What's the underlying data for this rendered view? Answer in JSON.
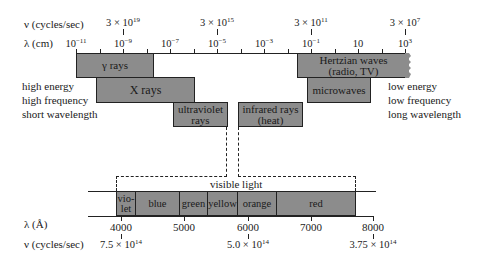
{
  "top_axis": {
    "freq_label": "ν (cycles/sec)",
    "wave_label": "λ (cm)",
    "wavelength_ticks": [
      {
        "base": "10",
        "exp": "−11",
        "x": 76
      },
      {
        "base": "10",
        "exp": "−9",
        "x": 123
      },
      {
        "base": "10",
        "exp": "−7",
        "x": 170
      },
      {
        "base": "10",
        "exp": "−5",
        "x": 217
      },
      {
        "base": "10",
        "exp": "−3",
        "x": 264
      },
      {
        "base": "10",
        "exp": "−1",
        "x": 311
      },
      {
        "base": "10",
        "exp": "",
        "x": 358
      },
      {
        "base": "10",
        "exp": "3",
        "x": 405
      }
    ],
    "frequency_ticks": [
      {
        "base": "3 × 10",
        "exp": "19",
        "x": 123
      },
      {
        "base": "3 × 10",
        "exp": "15",
        "x": 217
      },
      {
        "base": "3 × 10",
        "exp": "11",
        "x": 311
      },
      {
        "base": "3 × 10",
        "exp": "7",
        "x": 405
      }
    ]
  },
  "bands": {
    "gamma": "γ rays",
    "xray": "X rays",
    "uv_1": "ultraviolet",
    "uv_2": "rays",
    "ir_1": "infrared rays",
    "ir_2": "(heat)",
    "hertz_1": "Hertzian waves",
    "hertz_2": "(radio, TV)",
    "micro": "microwaves"
  },
  "left_notes": [
    "high energy",
    "high frequency",
    "short wavelength"
  ],
  "right_notes": [
    "low energy",
    "low frequency",
    "long wavelength"
  ],
  "visible": {
    "title": "visible light",
    "segments": [
      {
        "l1": "vio-",
        "l2": "let",
        "x": 116,
        "w": 20
      },
      {
        "l1": "blue",
        "l2": "",
        "x": 135,
        "w": 45
      },
      {
        "l1": "green",
        "l2": "",
        "x": 179,
        "w": 29
      },
      {
        "l1": "yellow",
        "l2": "",
        "x": 207,
        "w": 31
      },
      {
        "l1": "orange",
        "l2": "",
        "x": 237,
        "w": 40
      },
      {
        "l1": "red",
        "l2": "",
        "x": 276,
        "w": 80
      }
    ]
  },
  "bottom_axis": {
    "wave_label": "λ (Å)",
    "freq_label": "ν (cycles/sec)",
    "wavelength_ticks": [
      {
        "label": "4000",
        "x": 121
      },
      {
        "label": "5000",
        "x": 184
      },
      {
        "label": "6000",
        "x": 248
      },
      {
        "label": "7000",
        "x": 311
      },
      {
        "label": "8000",
        "x": 373
      }
    ],
    "frequency_ticks": [
      {
        "base": "7.5 × 10",
        "exp": "14",
        "x": 121
      },
      {
        "base": "5.0 × 10",
        "exp": "14",
        "x": 248
      },
      {
        "base": "3.75 × 10",
        "exp": "14",
        "x": 373
      }
    ]
  },
  "colors": {
    "band_fill": "#8c8c8c",
    "line": "#222222",
    "background": "#ffffff"
  }
}
